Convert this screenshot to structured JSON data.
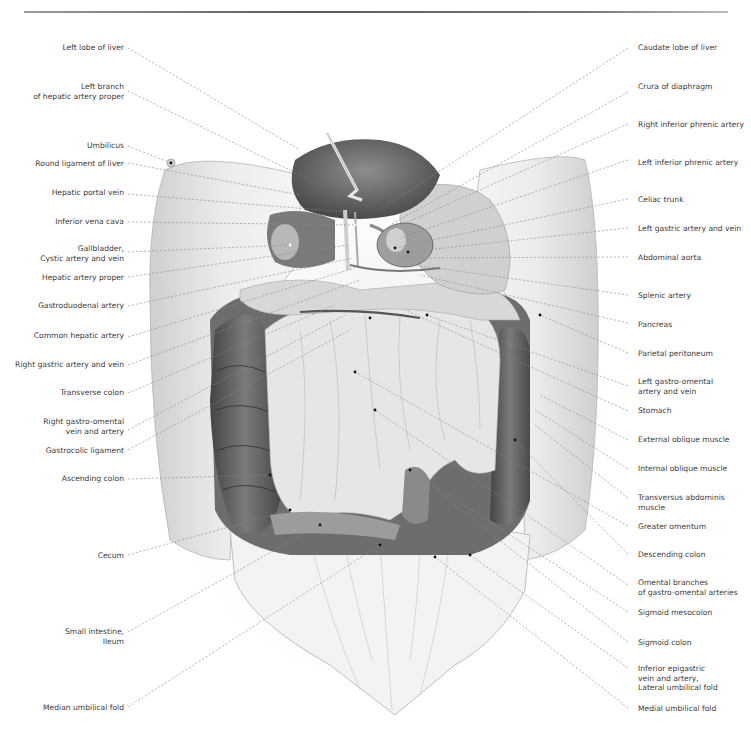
{
  "page": {
    "header_rule": true
  },
  "figure": {
    "left_labels": [
      {
        "text": "Left lobe of liver",
        "lines": [
          "Left lobe of liver"
        ]
      },
      {
        "text": "Left branch of hepatic artery proper",
        "lines": [
          "Left branch",
          "of hepatic artery proper"
        ]
      },
      {
        "text": "Umbilicus",
        "lines": [
          "Umbilicus"
        ]
      },
      {
        "text": "Round ligament of liver",
        "lines": [
          "Round ligament of liver"
        ]
      },
      {
        "text": "Hepatic portal vein",
        "lines": [
          "Hepatic portal vein"
        ]
      },
      {
        "text": "Inferior vena cava",
        "lines": [
          "Inferior vena cava"
        ]
      },
      {
        "text": "Gallbladder, Cystic artery and vein",
        "lines": [
          "Gallbladder,",
          "Cystic artery and vein"
        ]
      },
      {
        "text": "Hepatic artery proper",
        "lines": [
          "Hepatic artery proper"
        ]
      },
      {
        "text": "Gastroduodenal artery",
        "lines": [
          "Gastroduodenal artery"
        ]
      },
      {
        "text": "Common hepatic artery",
        "lines": [
          "Common hepatic artery"
        ]
      },
      {
        "text": "Right gastric artery and vein",
        "lines": [
          "Right gastric artery and vein"
        ]
      },
      {
        "text": "Transverse colon",
        "lines": [
          "Transverse colon"
        ]
      },
      {
        "text": "Right gastro-omental vein and artery",
        "lines": [
          "Right gastro-omental",
          "vein and artery"
        ]
      },
      {
        "text": "Gastrocolic ligament",
        "lines": [
          "Gastrocolic ligament"
        ]
      },
      {
        "text": "Ascending colon",
        "lines": [
          "Ascending colon"
        ]
      },
      {
        "text": "Cecum",
        "lines": [
          "Cecum"
        ]
      },
      {
        "text": "Small intestine, Ileum",
        "lines": [
          "Small intestine,",
          "Ileum"
        ]
      },
      {
        "text": "Median umbilical fold",
        "lines": [
          "Median umbilical fold"
        ]
      }
    ],
    "right_labels": [
      {
        "text": "Caudate lobe of liver",
        "lines": [
          "Caudate lobe of liver"
        ]
      },
      {
        "text": "Crura of diaphragm",
        "lines": [
          "Crura of diaphragm"
        ]
      },
      {
        "text": "Right inferior phrenic artery",
        "lines": [
          "Right inferior phrenic artery"
        ]
      },
      {
        "text": "Left inferior phrenic artery",
        "lines": [
          "Left inferior phrenic artery"
        ]
      },
      {
        "text": "Celiac trunk",
        "lines": [
          "Celiac trunk"
        ]
      },
      {
        "text": "Left gastric artery and vein",
        "lines": [
          "Left gastric artery and vein"
        ]
      },
      {
        "text": "Abdominal aorta",
        "lines": [
          "Abdominal aorta"
        ]
      },
      {
        "text": "Splenic artery",
        "lines": [
          "Splenic artery"
        ]
      },
      {
        "text": "Pancreas",
        "lines": [
          "Pancreas"
        ]
      },
      {
        "text": "Parietal peritoneum",
        "lines": [
          "Parietal peritoneum"
        ]
      },
      {
        "text": "Left gastro-omental artery and vein",
        "lines": [
          "Left gastro-omental",
          "artery and vein"
        ]
      },
      {
        "text": "Stomach",
        "lines": [
          "Stomach"
        ]
      },
      {
        "text": "External oblique muscle",
        "lines": [
          "External oblique muscle"
        ]
      },
      {
        "text": "Internal oblique muscle",
        "lines": [
          "Internal oblique muscle"
        ]
      },
      {
        "text": "Transversus abdominis muscle",
        "lines": [
          "Transversus abdominis",
          "muscle"
        ]
      },
      {
        "text": "Greater omentum",
        "lines": [
          "Greater omentum"
        ]
      },
      {
        "text": "Descending colon",
        "lines": [
          "Descending colon"
        ]
      },
      {
        "text": "Omental branches of gastro-omental arteries",
        "lines": [
          "Omental branches",
          "of gastro-omental arteries"
        ]
      },
      {
        "text": "Sigmoid mesocolon",
        "lines": [
          "Sigmoid mesocolon"
        ]
      },
      {
        "text": "Sigmoid colon",
        "lines": [
          "Sigmoid colon"
        ]
      },
      {
        "text": "Inferior epigastric vein and artery, Lateral umbilical fold",
        "lines": [
          "Inferior epigastric",
          "vein and artery,",
          "Lateral umbilical fold"
        ]
      },
      {
        "text": "Medial umbilical fold",
        "lines": [
          "Medial umbilical fold"
        ]
      }
    ]
  },
  "colors": {
    "skin_light": "#ededed",
    "skin_shadow": "#c9c9c9",
    "organ_dark": "#5b5b5b",
    "organ_mid": "#8c8c8c",
    "omentum": "#e4e4e4",
    "leader_line": "#8a8a8a",
    "label_text": "#3b3b3b"
  }
}
